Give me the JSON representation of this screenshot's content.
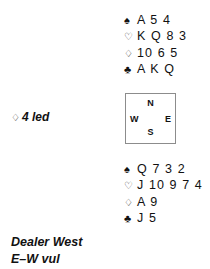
{
  "suits": {
    "spade": "♠",
    "heart": "♡",
    "diamond": "♢",
    "club": "♣"
  },
  "north_hand": {
    "label": "North hand",
    "rows": [
      {
        "suit": "♠",
        "cards": "A 5 4"
      },
      {
        "suit": "♡",
        "cards": "K Q 8 3"
      },
      {
        "suit": "♢",
        "cards": "10 6 5"
      },
      {
        "suit": "♣",
        "cards": "A K Q"
      }
    ]
  },
  "south_hand": {
    "label": "South hand",
    "rows": [
      {
        "suit": "♠",
        "cards": "Q 7 3 2"
      },
      {
        "suit": "♡",
        "cards": "J 10 9 7 4"
      },
      {
        "suit": "♢",
        "cards": "A 9"
      },
      {
        "suit": "♣",
        "cards": "J 5"
      }
    ]
  },
  "compass": {
    "north": "N",
    "south": "S",
    "west": "W",
    "east": "E"
  },
  "lead": {
    "suit_icon": "♢",
    "text": "4 led"
  },
  "caption": {
    "dealer": "Dealer West",
    "vulnerability": "E–W vul"
  },
  "colors": {
    "text": "#111111",
    "box_border": "#8c8c8c",
    "background": "#ffffff"
  }
}
